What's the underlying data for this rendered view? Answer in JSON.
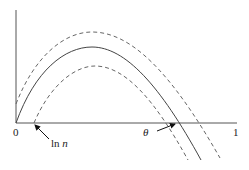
{
  "diagram": {
    "type": "function-plot",
    "axes": {
      "x_tick_labels": [
        "0",
        "1"
      ],
      "x_range": [
        0,
        1
      ]
    },
    "curves": [
      {
        "name": "main-curve",
        "style": "solid"
      },
      {
        "name": "upper-bound-curve",
        "style": "dashed"
      },
      {
        "name": "lower-bound-curve",
        "style": "dashed"
      }
    ],
    "annotations": [
      {
        "name": "ln-n-label",
        "text_main": "ln ",
        "text_italic": "n"
      },
      {
        "name": "theta-label",
        "text": "θ"
      }
    ],
    "colors": {
      "axis": "#555555",
      "solid_curve": "#444444",
      "dashed_curve": "#666666",
      "arrow": "#111111"
    }
  }
}
